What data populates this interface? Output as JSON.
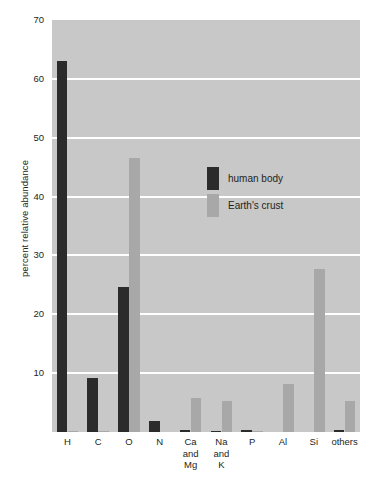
{
  "chart_data": {
    "type": "bar",
    "title": "",
    "xlabel": "",
    "ylabel": "percent relative abundance",
    "ylim": [
      0,
      70
    ],
    "yticks": [
      10,
      20,
      30,
      40,
      50,
      60,
      70
    ],
    "ytick_labels": [
      "10",
      "20",
      "30",
      "40",
      "50",
      "60",
      "70"
    ],
    "grid": true,
    "grid_color": "#ffffff",
    "plot_background": "#c8c8c8",
    "legend_position": "center-right-inside",
    "categories": [
      "H",
      "C",
      "O",
      "N",
      "Ca\nand\nMg",
      "Na\nand\nK",
      "P",
      "Al",
      "Si",
      "others"
    ],
    "series": [
      {
        "name": "human body",
        "color": "#2b2b2b",
        "values": [
          63.0,
          9.2,
          24.7,
          1.9,
          0.3,
          0.2,
          0.4,
          0.0,
          0.0,
          0.3
        ]
      },
      {
        "name": "Earth's crust",
        "color": "#a8a8a8",
        "values": [
          0.1,
          0.1,
          46.6,
          0.0,
          5.8,
          5.3,
          0.1,
          8.2,
          27.7,
          5.3
        ]
      }
    ]
  },
  "legend": {
    "items": [
      {
        "label": "human body",
        "color": "#2b2b2b"
      },
      {
        "label": "Earth's crust",
        "color": "#a8a8a8"
      }
    ]
  },
  "axes": {
    "y_title": "percent relative abundance"
  }
}
